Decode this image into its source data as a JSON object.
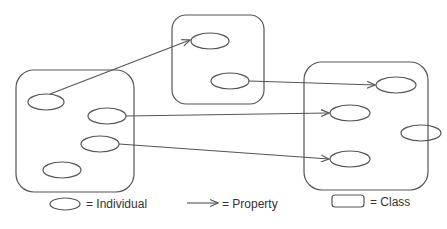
{
  "diagram": {
    "classes": [
      {
        "id": "class-left",
        "individuals": [
          "ind-l1",
          "ind-l2",
          "ind-l3",
          "ind-l4"
        ]
      },
      {
        "id": "class-middle",
        "individuals": [
          "ind-m1",
          "ind-m2"
        ]
      },
      {
        "id": "class-right",
        "individuals": [
          "ind-r1",
          "ind-r2",
          "ind-r3",
          "ind-r4"
        ]
      }
    ],
    "properties": [
      {
        "from": "ind-l1",
        "to": "ind-m1"
      },
      {
        "from": "ind-m2",
        "to": "ind-r1"
      },
      {
        "from": "ind-l2",
        "to": "ind-r2"
      },
      {
        "from": "ind-l3",
        "to": "ind-r4"
      }
    ]
  },
  "legend": {
    "individual_label": "= Individual",
    "property_label": "= Property",
    "class_label": "= Class"
  }
}
